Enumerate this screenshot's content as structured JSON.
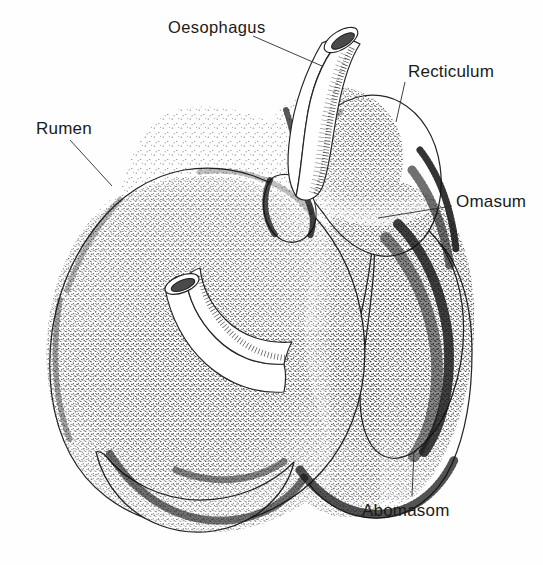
{
  "figure": {
    "medium": "pen-and-ink stipple illustration",
    "background_color": "#fefefe",
    "ink_color": "#262626",
    "width": 543,
    "height": 565,
    "cropped_caption_fragment": "p p g"
  },
  "labels": {
    "oesophagus": "Oesophagus",
    "recticulum": "Recticulum",
    "rumen": "Rumen",
    "omasum": "Omasum",
    "abomasom": "Abomasom"
  },
  "label_positions": {
    "oesophagus": {
      "x": 168,
      "y": 32
    },
    "recticulum": {
      "x": 408,
      "y": 76
    },
    "rumen": {
      "x": 36,
      "y": 133
    },
    "omasum": {
      "x": 455,
      "y": 206
    },
    "abomasom": {
      "x": 362,
      "y": 515
    }
  },
  "leaders": {
    "oesophagus": {
      "from_x": 253,
      "from_y": 36,
      "to_x": 322,
      "to_y": 65
    },
    "recticulum": {
      "from_x": 404,
      "from_y": 82,
      "to_x": 396,
      "to_y": 120
    },
    "rumen": {
      "from_x": 70,
      "from_y": 140,
      "to_x": 110,
      "to_y": 184
    },
    "omasum": {
      "from_x": 452,
      "from_y": 208,
      "to_x": 385,
      "to_y": 216
    },
    "abomasom": {
      "from_x": 412,
      "from_y": 495,
      "to_x": 414,
      "to_y": 455
    }
  },
  "structures": [
    {
      "name": "oesophagus",
      "type": "cut-tube",
      "description": "curved tube entering from upper area, cut obliquely at its free end"
    },
    {
      "name": "recticulum",
      "type": "chamber",
      "description": "rounded dome chamber at upper right of the mass"
    },
    {
      "name": "rumen",
      "type": "chamber",
      "description": "large rounded chamber forming the left two thirds of the mass"
    },
    {
      "name": "omasum",
      "type": "chamber",
      "description": "chamber on the right side below the recticulum"
    },
    {
      "name": "abomasom",
      "type": "chamber",
      "description": "chamber forming the lower right lobe of the mass"
    },
    {
      "name": "duodenum-stump",
      "type": "cut-tube",
      "description": "second cut tube emerging from the centre of the mass toward the lower left"
    }
  ],
  "icons": {
    "leader_line": "leader-line",
    "stipple": "stipple-shading"
  }
}
